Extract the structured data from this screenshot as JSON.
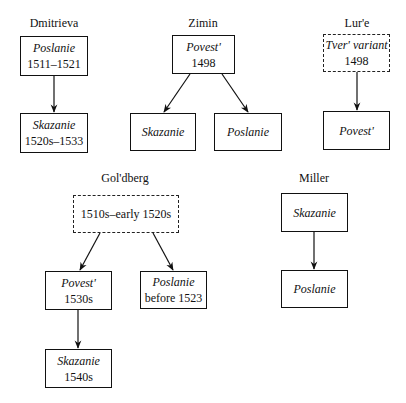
{
  "groups": {
    "dmitrieva": {
      "title": "Dmitrieva",
      "nodes": [
        {
          "name": "Poslanie",
          "date": "1511–1521",
          "style": "solid"
        },
        {
          "name": "Skazanie",
          "date": "1520s–1533",
          "style": "solid"
        }
      ]
    },
    "zimin": {
      "title": "Zimin",
      "nodes": [
        {
          "name": "Povest'",
          "date": "1498",
          "style": "solid"
        },
        {
          "name": "Skazanie",
          "date": "",
          "style": "solid"
        },
        {
          "name": "Poslanie",
          "date": "",
          "style": "solid"
        }
      ]
    },
    "lure": {
      "title": "Lur'e",
      "nodes": [
        {
          "name": "Tver' variant",
          "date": "1498",
          "style": "dashed"
        },
        {
          "name": "Povest'",
          "date": "",
          "style": "solid"
        }
      ]
    },
    "goldberg": {
      "title": "Gol'dberg",
      "nodes": [
        {
          "name": "",
          "date": "1510s–early 1520s",
          "style": "dashed"
        },
        {
          "name": "Povest'",
          "date": "1530s",
          "style": "solid"
        },
        {
          "name": "Poslanie",
          "date": "before 1523",
          "style": "solid"
        },
        {
          "name": "Skazanie",
          "date": "1540s",
          "style": "solid"
        }
      ]
    },
    "miller": {
      "title": "Miller",
      "nodes": [
        {
          "name": "Skazanie",
          "date": "",
          "style": "solid"
        },
        {
          "name": "Poslanie",
          "date": "",
          "style": "solid"
        }
      ]
    }
  },
  "edges": [
    {
      "group": "dmitrieva",
      "from": "Poslanie 1511–1521",
      "to": "Skazanie 1520s–1533"
    },
    {
      "group": "zimin",
      "from": "Povest' 1498",
      "to": "Skazanie"
    },
    {
      "group": "zimin",
      "from": "Povest' 1498",
      "to": "Poslanie"
    },
    {
      "group": "lure",
      "from": "Tver' variant 1498",
      "to": "Povest'"
    },
    {
      "group": "goldberg",
      "from": "1510s–early 1520s",
      "to": "Povest' 1530s"
    },
    {
      "group": "goldberg",
      "from": "1510s–early 1520s",
      "to": "Poslanie before 1523"
    },
    {
      "group": "goldberg",
      "from": "Povest' 1530s",
      "to": "Skazanie 1540s"
    },
    {
      "group": "miller",
      "from": "Skazanie",
      "to": "Poslanie"
    }
  ]
}
